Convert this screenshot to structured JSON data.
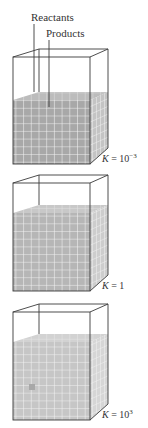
{
  "labels": {
    "reactants": "Reactants",
    "products": "Products"
  },
  "containers": [
    {
      "id": "box-1",
      "k_label": "K",
      "k_eq": " = 10",
      "k_exp": "−3",
      "fill_color": "#a8a8a8",
      "fill_top_y": 100
    },
    {
      "id": "box-2",
      "k_label": "K",
      "k_eq": " = 1",
      "k_exp": "",
      "fill_color": "#b8b8b8",
      "fill_top_y": 212
    },
    {
      "id": "box-3",
      "k_label": "K",
      "k_eq": " = 10",
      "k_exp": "3",
      "fill_color": "#c8c8c8",
      "fill_top_y": 340
    }
  ],
  "colors": {
    "outline": "#3a3a3a",
    "grid_line": "#f2f2f2",
    "text": "#333333"
  }
}
